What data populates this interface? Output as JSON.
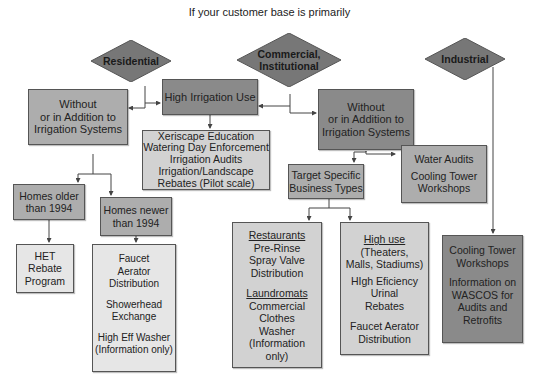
{
  "title": "If your customer base is primarily",
  "colors": {
    "diamond_fill": "#777777",
    "dark_box": "#8a8a8a",
    "mid_box": "#adadad",
    "light_box": "#d2d2d2",
    "lighter_box": "#e6e6e6",
    "connector": "#444444"
  },
  "categories": {
    "residential": "Residential",
    "commercial_line1": "Commercial,",
    "commercial_line2": "Institutional",
    "industrial": "Industrial"
  },
  "nodes": {
    "high_irrigation": "High Irrigation Use",
    "res_without": [
      "Without",
      "or in Addition to",
      "Irrigation Systems"
    ],
    "com_without": [
      "Without",
      "or in Addition to",
      "Irrigation Systems"
    ],
    "xeriscape": [
      "Xeriscape Education",
      "Watering Day Enforcement",
      "Irrigation Audits",
      "Irrigation/Landscape",
      "Rebates (Pilot scale)"
    ],
    "homes_older": [
      "Homes older",
      "than 1994"
    ],
    "homes_newer": [
      "Homes newer",
      "than 1994"
    ],
    "het": [
      "HET",
      "Rebate",
      "Program"
    ],
    "faucet": {
      "group1": [
        "Faucet",
        "Aerator",
        "Distribution"
      ],
      "group2": [
        "Showerhead",
        "Exchange"
      ],
      "group3": [
        "High Eff Washer",
        "(Information only)"
      ]
    },
    "target_specific": [
      "Target Specific",
      "Business Types"
    ],
    "water_audits": {
      "line1": "Water Audits",
      "group2": [
        "Cooling Tower",
        "Workshops"
      ]
    },
    "restaurants": {
      "heading1": "Restaurants",
      "group1": [
        "Pre-Rinse",
        "Spray Valve",
        "Distribution"
      ],
      "heading2": "Laundromats",
      "group2": [
        "Commercial",
        "Clothes",
        "Washer",
        "(Information",
        "only)"
      ]
    },
    "high_use": {
      "heading": "High use",
      "group1": [
        "(Theaters,",
        "Malls, Stadiums)"
      ],
      "group2": [
        "HIgh Eficiency",
        "Urinal",
        "Rebates"
      ],
      "group3": [
        "Faucet Aerator",
        "Distribution"
      ]
    },
    "industrial_box": {
      "group1": [
        "Cooling Tower",
        "Workshops"
      ],
      "group2": [
        "Information on",
        "WASCOS for",
        "Audits and",
        "Retrofits"
      ]
    }
  }
}
